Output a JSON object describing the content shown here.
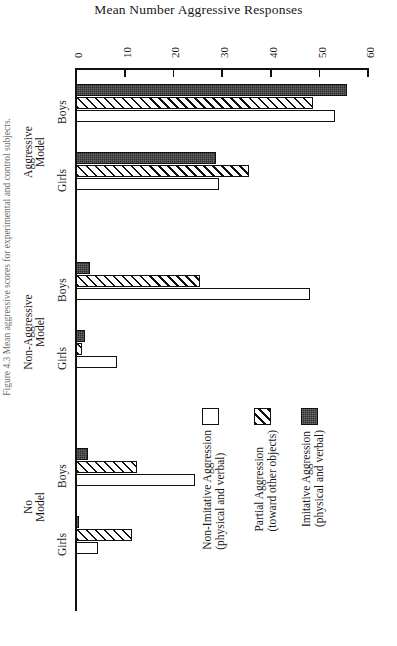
{
  "figure": {
    "caption": "Figure 4.3  Mean aggressive scores for experimental and control subjects."
  },
  "chart_data": {
    "type": "bar",
    "orientation": "horizontal",
    "title": "Mean Number Aggressive Responses",
    "xlabel": "",
    "ylabel": "",
    "xlim": [
      0,
      60
    ],
    "xticks": [
      0,
      10,
      20,
      30,
      40,
      50,
      60
    ],
    "tick_labels": [
      "0",
      "10",
      "20",
      "30",
      "40",
      "50",
      "60"
    ],
    "grid": false,
    "legend_position": "inside-right",
    "group_labels": [
      "Aggressive Model",
      "Non-Aggressive Model",
      "No Model"
    ],
    "categories": [
      "Aggressive Model / Boys",
      "Aggressive Model / Girls",
      "Non-Aggressive Model / Boys",
      "Non-Aggressive Model / Girls",
      "No Model / Boys",
      "No Model / Girls"
    ],
    "sex_labels": [
      "Boys",
      "Girls",
      "Boys",
      "Girls",
      "Boys",
      "Girls"
    ],
    "series": [
      {
        "name": "Imitative Aggression",
        "sub": "(physical and verbal)",
        "fill": "solid",
        "values": [
          55.6,
          28.7,
          2.9,
          1.8,
          2.4,
          0.5
        ]
      },
      {
        "name": "Partial Aggression",
        "sub": "(toward other objects)",
        "fill": "hatched",
        "values": [
          48.7,
          35.5,
          25.5,
          1.2,
          12.5,
          11.5
        ]
      },
      {
        "name": "Non-Imitative Aggression",
        "sub": "(physical and verbal)",
        "fill": "open",
        "values": [
          53.2,
          29.4,
          48.0,
          8.4,
          24.4,
          4.5
        ]
      }
    ]
  },
  "legend": {
    "entries": [
      {
        "label": "Imitative Aggression",
        "sub": "(physical and verbal)",
        "fill": "solid"
      },
      {
        "label": "Partial Aggression",
        "sub": "(toward other objects)",
        "fill": "hatch"
      },
      {
        "label": "Non-Imitative Aggression",
        "sub": "(physical and verbal)",
        "fill": "open"
      }
    ]
  },
  "axis": {
    "ticks": [
      {
        "value": 0,
        "label": "0"
      },
      {
        "value": 10,
        "label": "10"
      },
      {
        "value": 20,
        "label": "20"
      },
      {
        "value": 30,
        "label": "30"
      },
      {
        "value": 40,
        "label": "40"
      },
      {
        "value": 50,
        "label": "50"
      },
      {
        "value": 60,
        "label": "60"
      }
    ]
  },
  "groups": [
    {
      "model": "Aggressive\nModel",
      "model_l1": "Aggressive",
      "model_l2": "Model",
      "sexes": [
        "Boys",
        "Girls"
      ]
    },
    {
      "model": "Non-Aggressive\nModel",
      "model_l1": "Non-Aggressive",
      "model_l2": "Model",
      "sexes": [
        "Boys",
        "Girls"
      ]
    },
    {
      "model": "No\nModel",
      "model_l1": "No",
      "model_l2": "Model",
      "sexes": [
        "Boys",
        "Girls"
      ]
    }
  ]
}
